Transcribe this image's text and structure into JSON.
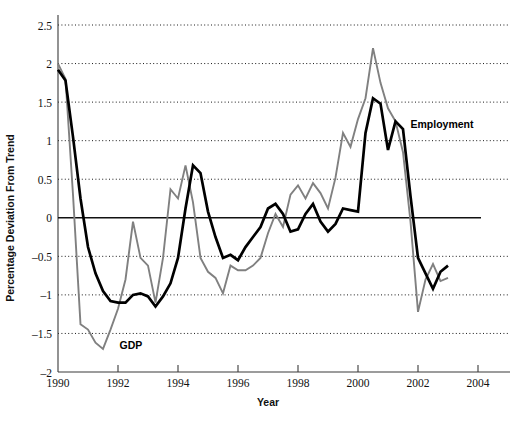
{
  "chart_data": {
    "type": "line",
    "title": "",
    "xlabel": "Year",
    "ylabel": "Percentage Deviation From Trend",
    "xlim": [
      1990,
      2004
    ],
    "ylim": [
      -2,
      2.5
    ],
    "xticks": [
      "1990",
      "1992",
      "1994",
      "1996",
      "1998",
      "2000",
      "2002",
      "2004"
    ],
    "xtick_values": [
      1990,
      1992,
      1994,
      1996,
      1998,
      2000,
      2002,
      2004
    ],
    "yticks": [
      "2.5",
      "2",
      "1.5",
      "1",
      "0.5",
      "0",
      "–0.5",
      "–1",
      "–1.5",
      "–2"
    ],
    "ytick_values": [
      2.5,
      2,
      1.5,
      1,
      0.5,
      0,
      -0.5,
      -1,
      -1.5,
      -2
    ],
    "grid": "horizontal-dotted",
    "legend": "inline-annotations",
    "colors": {
      "gdp": "#808080",
      "employment": "#000000",
      "axis": "#3a3a3a",
      "grid": "#1a1a1a",
      "background": "#ffffff"
    },
    "annotations": [
      {
        "name": "gdp-label",
        "text": "GDP",
        "x": 1992.05,
        "y": -1.655
      },
      {
        "name": "employment-label",
        "text": "Employment",
        "x": 2001.75,
        "y": 1.22
      }
    ],
    "series": [
      {
        "name": "GDP",
        "color": "#808080",
        "x": [
          1990.0,
          1990.25,
          1990.5,
          1990.75,
          1991.0,
          1991.25,
          1991.5,
          1991.75,
          1992.0,
          1992.25,
          1992.5,
          1992.75,
          1993.0,
          1993.25,
          1993.5,
          1993.75,
          1994.0,
          1994.25,
          1994.5,
          1994.75,
          1995.0,
          1995.25,
          1995.5,
          1995.75,
          1996.0,
          1996.25,
          1996.5,
          1996.75,
          1997.0,
          1997.25,
          1997.5,
          1997.75,
          1998.0,
          1998.25,
          1998.5,
          1998.75,
          1999.0,
          1999.25,
          1999.5,
          1999.75,
          2000.0,
          2000.25,
          2000.5,
          2000.75,
          2001.0,
          2001.25,
          2001.5,
          2001.75,
          2002.0,
          2002.25,
          2002.5,
          2002.75,
          2003.0
        ],
        "values": [
          2.0,
          1.8,
          0.3,
          -1.38,
          -1.45,
          -1.62,
          -1.7,
          -1.45,
          -1.18,
          -0.8,
          -0.05,
          -0.52,
          -0.62,
          -1.1,
          -0.52,
          0.37,
          0.25,
          0.68,
          0.2,
          -0.52,
          -0.7,
          -0.78,
          -0.98,
          -0.62,
          -0.68,
          -0.68,
          -0.62,
          -0.52,
          -0.2,
          0.05,
          -0.12,
          0.3,
          0.42,
          0.25,
          0.45,
          0.32,
          0.12,
          0.52,
          1.1,
          0.92,
          1.28,
          1.55,
          2.2,
          1.75,
          1.42,
          1.25,
          0.85,
          -0.05,
          -1.22,
          -0.8,
          -0.6,
          -0.82,
          -0.78
        ]
      },
      {
        "name": "Employment",
        "color": "#000000",
        "x": [
          1990.0,
          1990.25,
          1990.5,
          1990.75,
          1991.0,
          1991.25,
          1991.5,
          1991.75,
          1992.0,
          1992.25,
          1992.5,
          1992.75,
          1993.0,
          1993.25,
          1993.5,
          1993.75,
          1994.0,
          1994.25,
          1994.5,
          1994.75,
          1995.0,
          1995.25,
          1995.5,
          1995.75,
          1996.0,
          1996.25,
          1996.5,
          1996.75,
          1997.0,
          1997.25,
          1997.5,
          1997.75,
          1998.0,
          1998.25,
          1998.5,
          1998.75,
          1999.0,
          1999.25,
          1999.5,
          1999.75,
          2000.0,
          2000.25,
          2000.5,
          2000.75,
          2001.0,
          2001.25,
          2001.5,
          2001.75,
          2002.0,
          2002.25,
          2002.5,
          2002.75,
          2003.0
        ],
        "values": [
          1.92,
          1.78,
          1.05,
          0.25,
          -0.38,
          -0.72,
          -0.95,
          -1.08,
          -1.1,
          -1.1,
          -1.0,
          -0.98,
          -1.02,
          -1.15,
          -1.02,
          -0.85,
          -0.52,
          0.12,
          0.68,
          0.58,
          0.08,
          -0.25,
          -0.52,
          -0.48,
          -0.55,
          -0.38,
          -0.25,
          -0.12,
          0.12,
          0.18,
          0.05,
          -0.18,
          -0.15,
          0.05,
          0.18,
          -0.05,
          -0.18,
          -0.08,
          0.12,
          0.1,
          0.08,
          1.1,
          1.55,
          1.48,
          0.88,
          1.25,
          1.15,
          0.28,
          -0.52,
          -0.72,
          -0.92,
          -0.7,
          -0.62
        ]
      }
    ]
  }
}
